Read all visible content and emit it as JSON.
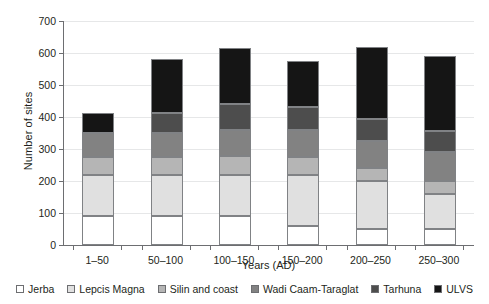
{
  "chart_data": {
    "type": "bar",
    "subtype": "stacked-bar",
    "title": "",
    "xlabel": "Years (AD)",
    "ylabel": "Number of sites",
    "categories": [
      "1–50",
      "50–100",
      "100–150",
      "150–200",
      "200–250",
      "250–300"
    ],
    "ylim": [
      0,
      700
    ],
    "yticks": [
      0,
      100,
      200,
      300,
      400,
      500,
      600,
      700
    ],
    "grid": true,
    "legend_position": "bottom",
    "series": [
      {
        "name": "Jerba",
        "color": "#ffffff",
        "values": [
          90,
          90,
          90,
          60,
          50,
          50
        ]
      },
      {
        "name": "Lepcis Magna",
        "color": "#e0e0e0",
        "values": [
          130,
          130,
          130,
          160,
          150,
          110
        ]
      },
      {
        "name": "Silin and coast",
        "color": "#b5b5b5",
        "values": [
          55,
          55,
          58,
          55,
          40,
          40
        ]
      },
      {
        "name": "Wadi Caam-Taraglat",
        "color": "#828282",
        "values": [
          75,
          75,
          82,
          85,
          85,
          90
        ]
      },
      {
        "name": "Tarhuna",
        "color": "#4d4d4d",
        "values": [
          0,
          62,
          80,
          70,
          70,
          65
        ]
      },
      {
        "name": "ULVS",
        "color": "#151515",
        "values": [
          62,
          170,
          175,
          145,
          225,
          235
        ]
      }
    ],
    "totals": [
      412,
      582,
      615,
      575,
      620,
      590
    ]
  },
  "legend": {
    "items": [
      {
        "label": "Jerba"
      },
      {
        "label": "Lepcis Magna"
      },
      {
        "label": "Silin and coast"
      },
      {
        "label": "Wadi Caam-Taraglat"
      },
      {
        "label": "Tarhuna"
      },
      {
        "label": "ULVS"
      }
    ]
  }
}
